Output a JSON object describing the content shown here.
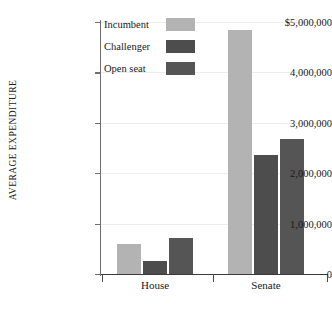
{
  "chart_data": {
    "type": "bar",
    "title": "",
    "xlabel": "",
    "ylabel": "AVERAGE EXPENDITURE",
    "categories": [
      "House",
      "Senate"
    ],
    "series": [
      {
        "name": "Incumbent",
        "values": [
          600000,
          4850000
        ],
        "color": "#b3b3b3"
      },
      {
        "name": "Challenger",
        "values": [
          250000,
          2370000
        ],
        "color": "#4d4d4d"
      },
      {
        "name": "Open seat",
        "values": [
          720000,
          2670000
        ],
        "color": "#555555"
      }
    ],
    "ylim": [
      0,
      5000000
    ],
    "ytick_labels": [
      "$5,000,000",
      "4,000,000",
      "3,000,000",
      "2,000,000",
      "1,000,000",
      "0"
    ],
    "ytick_values": [
      5000000,
      4000000,
      3000000,
      2000000,
      1000000,
      0
    ],
    "grid": true,
    "legend_position": "top-left-inside"
  },
  "legend": {
    "entries": [
      {
        "label": "Incumbent",
        "color": "#b3b3b3"
      },
      {
        "label": "Challenger",
        "color": "#4d4d4d"
      },
      {
        "label": "Open seat",
        "color": "#555555"
      }
    ]
  },
  "axes": {
    "y_title": "AVERAGE EXPENDITURE",
    "x_categories": [
      "House",
      "Senate"
    ]
  }
}
